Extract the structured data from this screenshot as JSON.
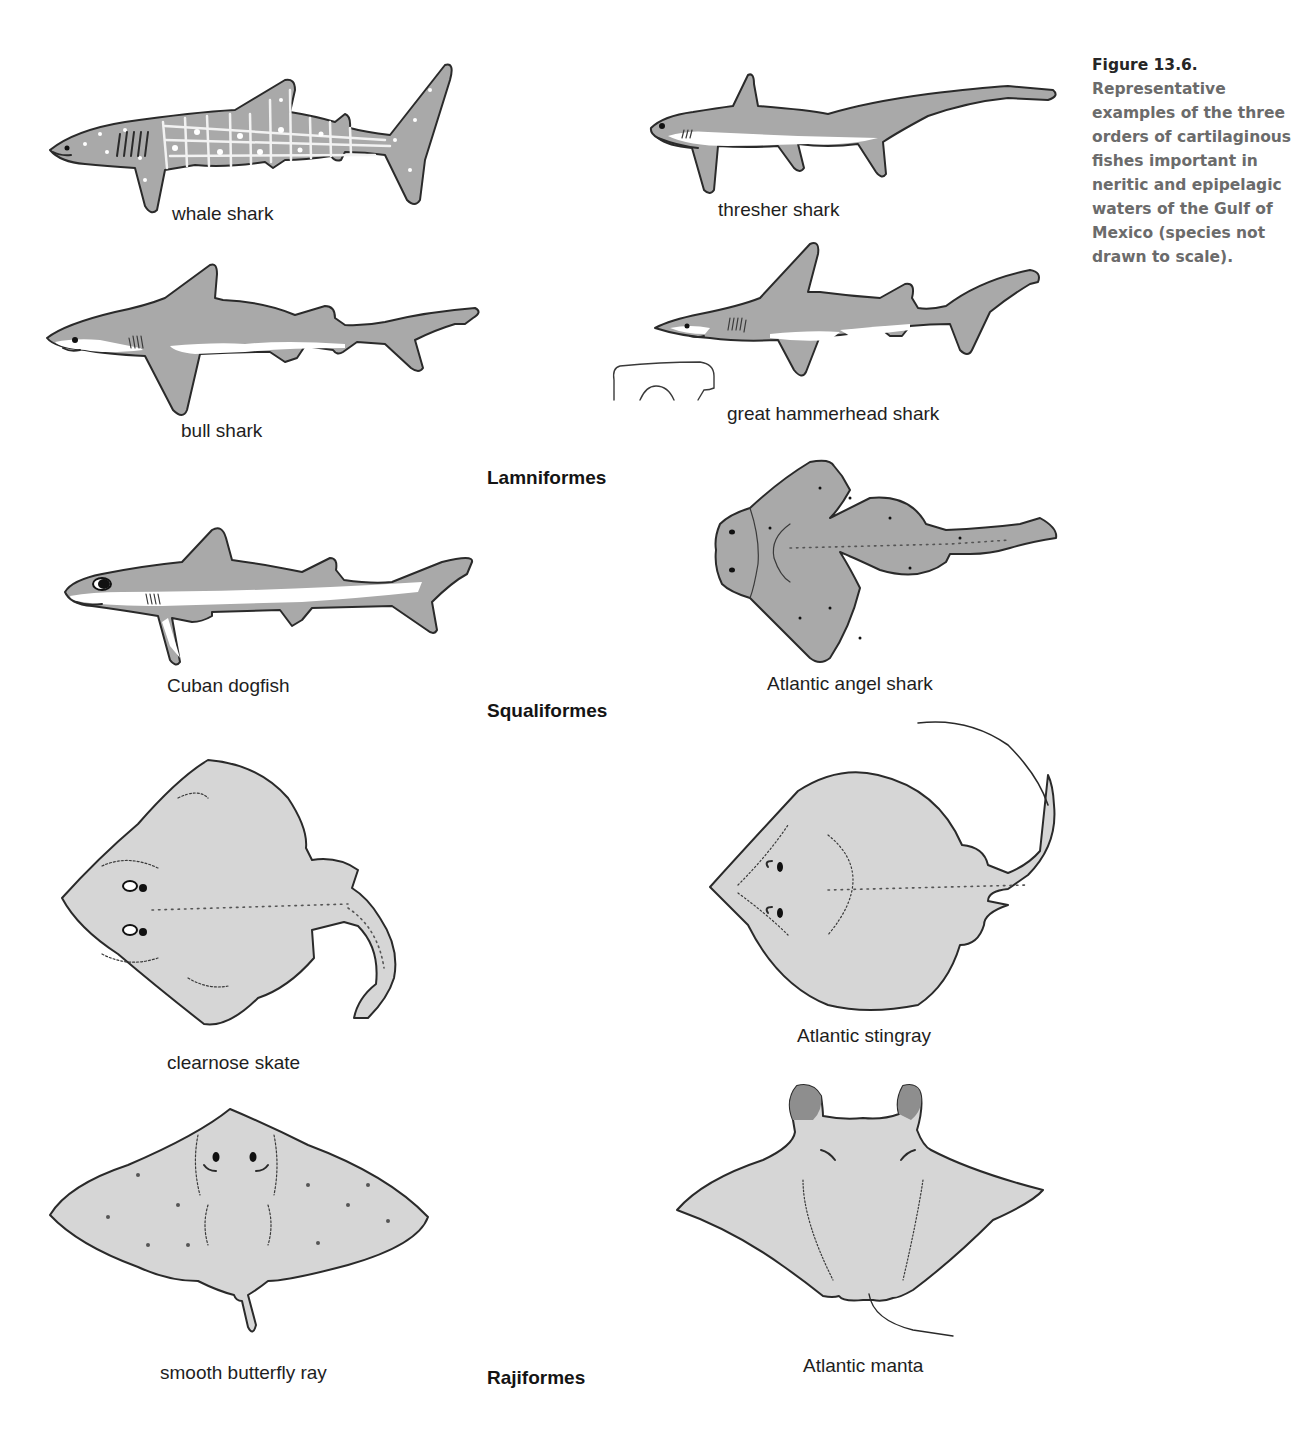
{
  "caption": {
    "figure_number": "Figure 13.6.",
    "text": "Representative examples of the three orders of cartilaginous fishes important in neritic and epipelagic waters of the Gulf of Mexico (species not drawn to scale)."
  },
  "orders": {
    "lamniformes": "Lamniformes",
    "squaliformes": "Squaliformes",
    "rajiformes": "Rajiformes"
  },
  "species": {
    "whale_shark": "whale shark",
    "thresher_shark": "thresher shark",
    "bull_shark": "bull shark",
    "great_hammerhead_shark": "great hammerhead shark",
    "cuban_dogfish": "Cuban dogfish",
    "atlantic_angel_shark": "Atlantic angel shark",
    "clearnose_skate": "clearnose skate",
    "atlantic_stingray": "Atlantic stingray",
    "smooth_butterfly_ray": "smooth butterfly ray",
    "atlantic_manta": "Atlantic manta"
  },
  "colors": {
    "shark_body": "#a9a9a9",
    "ray_body": "#d6d6d6",
    "caption_title": "#262626",
    "caption_text": "#6b6b6b"
  }
}
